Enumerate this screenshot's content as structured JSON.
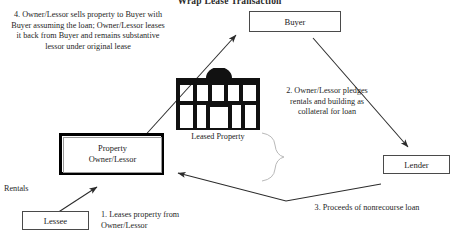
{
  "diagram": {
    "title": "Wrap Lease Transaction",
    "boxes": {
      "buyer": "Buyer",
      "lender": "Lender",
      "lessee": "Lessee",
      "owner_line1": "Property",
      "owner_line2": "Owner/Lessor"
    },
    "property_icon_label": "Leased Property",
    "notes": {
      "step4": "4.  Owner/Lessor sells property to Buyer with Buyer assuming the loan; Owner/Lessor leases it back from Buyer and remains substantive lessor under original lease",
      "step2": "2.  Owner/Lessor pledges rentals and building as collateral for loan",
      "step1": "1.  Leases property from Owner/Lessor",
      "step3": "3.  Proceeds of nonrecourse loan",
      "rentals": "Rentals"
    },
    "colors": {
      "line": "#2b2b2b",
      "box_border": "#4a4a4a",
      "thick_border": "#000000",
      "background": "#ffffff",
      "faint_line": "#b9b9b9"
    }
  }
}
